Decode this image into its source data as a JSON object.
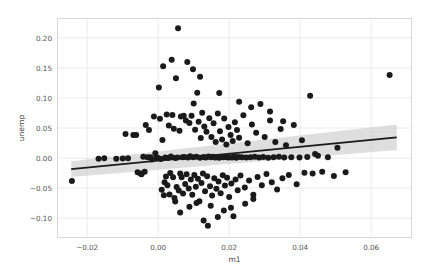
{
  "chart_data": {
    "type": "scatter",
    "title": "",
    "xlabel": "m1",
    "ylabel": "unemp",
    "xlim": [
      -0.0285,
      0.0715
    ],
    "ylim": [
      -0.133,
      0.233
    ],
    "xticks": [
      -0.02,
      0.0,
      0.02,
      0.04,
      0.06
    ],
    "xticklabels": [
      "−0.02",
      "0.00",
      "0.02",
      "0.04",
      "0.06"
    ],
    "yticks": [
      -0.1,
      -0.05,
      0.0,
      0.05,
      0.1,
      0.15,
      0.2
    ],
    "yticklabels": [
      "−0.10",
      "−0.05",
      "0.00",
      "0.05",
      "0.10",
      "0.15",
      "0.20"
    ],
    "grid": true,
    "legend": "none",
    "marker_color": "#1a1a1a",
    "marker_size": 3.0,
    "line_color": "#1a1a1a",
    "band_color": "#c9c9c9",
    "grid_color": "#e8e8e8",
    "frame_color": "#d6d6d6",
    "background": "#ffffff",
    "regression": {
      "x_start": -0.0245,
      "y_start": -0.0185,
      "x_end": 0.0672,
      "y_end": 0.0345,
      "band_lower_start": -0.0315,
      "band_upper_start": -0.0055,
      "band_lower_end": 0.0135,
      "band_upper_end": 0.056
    },
    "points": [
      [
        -0.0243,
        -0.0382
      ],
      [
        -0.0118,
        -0.0012
      ],
      [
        -0.01,
        -0.0008
      ],
      [
        -0.0092,
        0.0402
      ],
      [
        -0.0085,
        -0.0005
      ],
      [
        -0.007,
        0.0385
      ],
      [
        -0.0062,
        0.0385
      ],
      [
        -0.0058,
        -0.0238
      ],
      [
        -0.005,
        -0.0255
      ],
      [
        -0.0047,
        -0.0268
      ],
      [
        -0.0042,
        0.002
      ],
      [
        -0.0038,
        -0.0228
      ],
      [
        -0.0035,
        0.055
      ],
      [
        -0.003,
        0.0012
      ],
      [
        -0.0026,
        0.0465
      ],
      [
        -0.0022,
        0.0015
      ],
      [
        -0.0018,
        -0.0022
      ],
      [
        -0.0012,
        0.069
      ],
      [
        -0.0008,
        0.008
      ],
      [
        -0.0005,
        0.001
      ],
      [
        0.0,
        0.0
      ],
      [
        0.0002,
        0.1175
      ],
      [
        0.0005,
        0.0655
      ],
      [
        0.0008,
        -0.0015
      ],
      [
        0.001,
        -0.0528
      ],
      [
        0.0012,
        0.03
      ],
      [
        0.0014,
        0.1528
      ],
      [
        0.0016,
        -0.0618
      ],
      [
        0.0018,
        -0.0402
      ],
      [
        0.002,
        0.0008
      ],
      [
        0.0022,
        -0.0305
      ],
      [
        0.0024,
        0.0725
      ],
      [
        0.0026,
        -0.0452
      ],
      [
        0.0028,
        0.0002
      ],
      [
        0.003,
        0.054
      ],
      [
        0.0032,
        -0.0605
      ],
      [
        0.0034,
        -0.0248
      ],
      [
        0.0036,
        0.0025
      ],
      [
        0.0038,
        0.1635
      ],
      [
        0.004,
        0.0718
      ],
      [
        0.0042,
        -0.032
      ],
      [
        0.0044,
        0.0488
      ],
      [
        0.0046,
        -0.0665
      ],
      [
        0.0048,
        0.0
      ],
      [
        0.005,
        0.1328
      ],
      [
        0.0052,
        -0.0482
      ],
      [
        0.0054,
        0.001
      ],
      [
        0.0056,
        0.216
      ],
      [
        0.0058,
        -0.0538
      ],
      [
        0.006,
        0.0455
      ],
      [
        0.0062,
        -0.0258
      ],
      [
        0.0064,
        0.069
      ],
      [
        0.0066,
        -0.0318
      ],
      [
        0.0068,
        0.0012
      ],
      [
        0.007,
        -0.0588
      ],
      [
        0.0072,
        0.0705
      ],
      [
        0.0074,
        0.0018
      ],
      [
        0.0076,
        -0.0432
      ],
      [
        0.0078,
        0.0625
      ],
      [
        0.008,
        -0.0268
      ],
      [
        0.0082,
        0.1598
      ],
      [
        0.0084,
        0.0008
      ],
      [
        0.0086,
        -0.0508
      ],
      [
        0.0088,
        0.0582
      ],
      [
        0.009,
        0.003
      ],
      [
        0.0092,
        -0.0358
      ],
      [
        0.0094,
        0.0705
      ],
      [
        0.0096,
        -0.0612
      ],
      [
        0.0098,
        0.0015
      ],
      [
        0.01,
        0.0908
      ],
      [
        0.0102,
        -0.0282
      ],
      [
        0.0104,
        0.047
      ],
      [
        0.0106,
        -0.0478
      ],
      [
        0.0108,
        0.002
      ],
      [
        0.011,
        0.1085
      ],
      [
        0.0112,
        -0.0345
      ],
      [
        0.0114,
        0.0605
      ],
      [
        0.0116,
        -0.0718
      ],
      [
        0.0118,
        0.0005
      ],
      [
        0.012,
        0.0332
      ],
      [
        0.0122,
        -0.0415
      ],
      [
        0.0124,
        0.0752
      ],
      [
        0.0126,
        -0.0255
      ],
      [
        0.0128,
        0.0018
      ],
      [
        0.013,
        0.0525
      ],
      [
        0.0132,
        -0.0552
      ],
      [
        0.0134,
        0.001
      ],
      [
        0.0136,
        0.0438
      ],
      [
        0.0138,
        -0.0302
      ],
      [
        0.014,
        -0.1125
      ],
      [
        0.0142,
        0.0025
      ],
      [
        0.0144,
        0.0662
      ],
      [
        0.0146,
        -0.0468
      ],
      [
        0.0148,
        0.0012
      ],
      [
        0.015,
        0.0352
      ],
      [
        0.0152,
        -0.0625
      ],
      [
        0.0154,
        0.0022
      ],
      [
        0.0156,
        0.0578
      ],
      [
        0.0158,
        -0.0338
      ],
      [
        0.016,
        0.0008
      ],
      [
        0.0162,
        0.0268
      ],
      [
        0.0164,
        -0.0512
      ],
      [
        0.0166,
        0.0015
      ],
      [
        0.0168,
        0.0742
      ],
      [
        0.017,
        -0.0392
      ],
      [
        0.0172,
        0.0005
      ],
      [
        0.0174,
        0.0448
      ],
      [
        0.0176,
        -0.0585
      ],
      [
        0.0178,
        0.0018
      ],
      [
        0.018,
        0.031
      ],
      [
        0.0182,
        -0.0285
      ],
      [
        0.0184,
        0.0012
      ],
      [
        0.0186,
        0.0658
      ],
      [
        0.0188,
        -0.0458
      ],
      [
        0.019,
        0.002
      ],
      [
        0.0192,
        0.0225
      ],
      [
        0.0194,
        -0.0328
      ],
      [
        0.0196,
        0.0008
      ],
      [
        0.0198,
        0.0515
      ],
      [
        0.02,
        -0.0648
      ],
      [
        0.0202,
        0.0015
      ],
      [
        0.0204,
        0.0385
      ],
      [
        0.0206,
        -0.0422
      ],
      [
        0.0208,
        0.001
      ],
      [
        0.021,
        0.0282
      ],
      [
        0.0212,
        -0.0968
      ],
      [
        0.0214,
        0.0025
      ],
      [
        0.0216,
        0.0595
      ],
      [
        0.0218,
        -0.0355
      ],
      [
        0.022,
        0.0005
      ],
      [
        0.0222,
        0.0468
      ],
      [
        0.0224,
        -0.0535
      ],
      [
        0.0226,
        0.0018
      ],
      [
        0.0228,
        0.0338
      ],
      [
        0.0232,
        -0.0292
      ],
      [
        0.0236,
        0.0012
      ],
      [
        0.024,
        0.0712
      ],
      [
        0.0244,
        -0.0488
      ],
      [
        0.0248,
        0.0008
      ],
      [
        0.0252,
        0.0245
      ],
      [
        0.0256,
        -0.0372
      ],
      [
        0.026,
        0.0015
      ],
      [
        0.0264,
        0.0558
      ],
      [
        0.0268,
        -0.0612
      ],
      [
        0.0272,
        0.002
      ],
      [
        0.0276,
        0.0422
      ],
      [
        0.028,
        -0.0315
      ],
      [
        0.0284,
        0.001
      ],
      [
        0.0288,
        0.0898
      ],
      [
        0.0292,
        -0.0452
      ],
      [
        0.0296,
        0.0018
      ],
      [
        0.03,
        0.0352
      ],
      [
        0.0305,
        -0.0265
      ],
      [
        0.031,
        0.0005
      ],
      [
        0.0315,
        0.0625
      ],
      [
        0.032,
        -0.0402
      ],
      [
        0.0325,
        0.0012
      ],
      [
        0.033,
        0.0268
      ],
      [
        0.0335,
        -0.0522
      ],
      [
        0.034,
        0.002
      ],
      [
        0.0345,
        0.0485
      ],
      [
        0.035,
        -0.0338
      ],
      [
        0.0355,
        0.0008
      ],
      [
        0.036,
        0.0212
      ],
      [
        0.0368,
        -0.0282
      ],
      [
        0.0375,
        0.0015
      ],
      [
        0.0382,
        0.0548
      ],
      [
        0.039,
        -0.0435
      ],
      [
        0.0398,
        0.001
      ],
      [
        0.0405,
        0.0298
      ],
      [
        0.0412,
        -0.0245
      ],
      [
        0.042,
        0.0018
      ],
      [
        0.0428,
        0.1035
      ],
      [
        0.0435,
        -0.0258
      ],
      [
        0.0442,
        0.0068
      ],
      [
        0.045,
        0.0038
      ],
      [
        0.0462,
        -0.0228
      ],
      [
        0.0478,
        0.0012
      ],
      [
        0.0495,
        -0.0298
      ],
      [
        0.0505,
        0.0172
      ],
      [
        0.0528,
        -0.0235
      ],
      [
        0.0652,
        0.1382
      ],
      [
        -0.0152,
        -0.0005
      ],
      [
        -0.0168,
        -0.001
      ],
      [
        0.0205,
        -0.0828
      ],
      [
        0.0185,
        -0.0872
      ],
      [
        0.0168,
        -0.0982
      ],
      [
        0.0148,
        -0.0795
      ],
      [
        0.0128,
        -0.1038
      ],
      [
        0.0108,
        -0.0748
      ],
      [
        0.0245,
        -0.0762
      ],
      [
        0.0268,
        -0.0682
      ],
      [
        0.0118,
        0.1352
      ],
      [
        0.0098,
        0.1478
      ],
      [
        0.0315,
        0.0775
      ],
      [
        0.0352,
        0.0612
      ],
      [
        0.0262,
        0.0845
      ],
      [
        0.0228,
        0.0935
      ],
      [
        0.0172,
        0.1082
      ],
      [
        0.0062,
        -0.0905
      ],
      [
        0.0048,
        -0.0722
      ],
      [
        0.0088,
        -0.0812
      ]
    ]
  }
}
